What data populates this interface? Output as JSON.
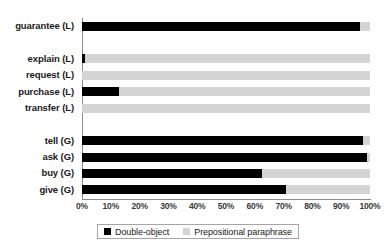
{
  "chart_data": {
    "type": "bar",
    "orientation": "horizontal",
    "stacked": true,
    "normalized_percent": true,
    "title": "",
    "subtitle": "",
    "xlabel": "",
    "ylabel": "",
    "xlim": [
      0,
      100
    ],
    "xticks": [
      0,
      10,
      20,
      30,
      40,
      50,
      60,
      70,
      80,
      90,
      100
    ],
    "xtick_labels": [
      "0%",
      "10%",
      "20%",
      "30%",
      "40%",
      "50%",
      "60%",
      "70%",
      "80%",
      "90%",
      "100%"
    ],
    "grid": false,
    "legend_position": "bottom",
    "categories": [
      "guarantee (L)",
      "",
      "explain (L)",
      "request (L)",
      "purchase (L)",
      "transfer (L)",
      "",
      "tell (G)",
      "ask (G)",
      "buy (G)",
      "give (G)"
    ],
    "series": [
      {
        "name": "Double-object",
        "color": "#000000",
        "values": [
          96.5,
          null,
          1.0,
          0.0,
          13.0,
          0.0,
          null,
          97.5,
          99.0,
          62.5,
          71.0
        ]
      },
      {
        "name": "Prepositional paraphrase",
        "color": "#d4d4d4",
        "values": [
          3.5,
          null,
          99.0,
          100.0,
          87.0,
          100.0,
          null,
          2.5,
          1.0,
          37.5,
          29.0
        ]
      }
    ],
    "legend": [
      {
        "label": "Double-object",
        "color": "#000000",
        "swatch": "black-square-icon"
      },
      {
        "label": "Prepositional paraphrase",
        "color": "#d4d4d4",
        "swatch": "gray-square-icon"
      }
    ]
  },
  "colors": {
    "double_object": "#000000",
    "prepositional": "#d4d4d4",
    "axis": "#8c8c8c",
    "text": "#1a1a1a",
    "tick_text": "#3a3a3a",
    "background": "#ffffff",
    "legend_border": "#a6a6a6"
  }
}
